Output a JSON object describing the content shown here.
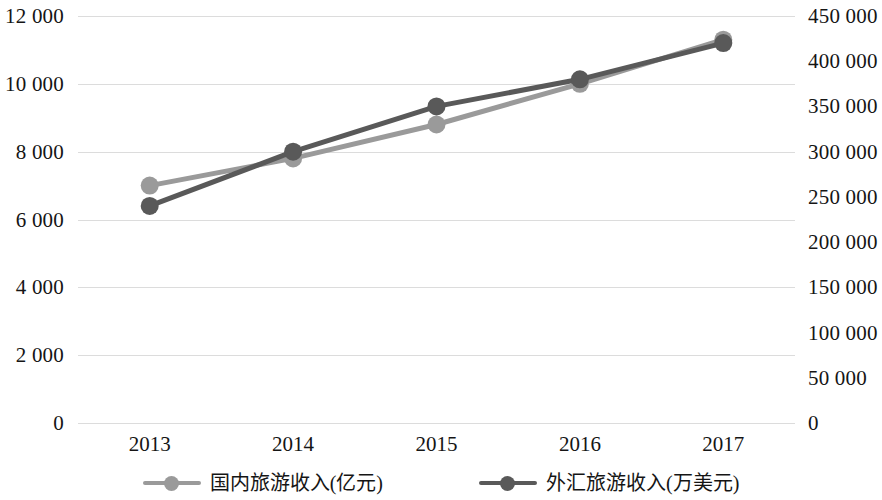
{
  "chart_data": {
    "type": "line",
    "title": "",
    "xlabel": "",
    "ylabel": "",
    "grid": true,
    "legend_position": "bottom",
    "categories": [
      "2013",
      "2014",
      "2015",
      "2016",
      "2017"
    ],
    "axes": {
      "left": {
        "label": "国内旅游收入(亿元)",
        "ylim": [
          0,
          12000
        ],
        "ticks": [
          "0",
          "2 000",
          "4 000",
          "6 000",
          "8 000",
          "10 000",
          "12 000"
        ],
        "tick_values": [
          0,
          2000,
          4000,
          6000,
          8000,
          10000,
          12000
        ]
      },
      "right": {
        "label": "外汇旅游收入(万美元)",
        "ylim": [
          0,
          450000
        ],
        "ticks": [
          "0",
          "50 000",
          "100 000",
          "150 000",
          "200 000",
          "250 000",
          "300 000",
          "350 000",
          "400 000",
          "450 000"
        ],
        "tick_values": [
          0,
          50000,
          100000,
          150000,
          200000,
          250000,
          300000,
          350000,
          400000,
          450000
        ]
      }
    },
    "series": [
      {
        "name": "国内旅游收入(亿元)",
        "axis": "left",
        "color": "#9a9a9a",
        "marker": "circle",
        "values": [
          7000,
          7800,
          8800,
          10000,
          11300
        ]
      },
      {
        "name": "外汇旅游收入(万美元)",
        "axis": "right",
        "color": "#595959",
        "marker": "circle",
        "values": [
          240000,
          300000,
          350000,
          380000,
          420000
        ]
      }
    ]
  },
  "legend": {
    "items": [
      {
        "label": "国内旅游收入(亿元)",
        "color": "#9a9a9a"
      },
      {
        "label": "外汇旅游收入(万美元)",
        "color": "#595959"
      }
    ]
  },
  "colors": {
    "domestic_series": "#9a9a9a",
    "foreign_series": "#595959",
    "gridline": "#d6d6d6",
    "text": "#151515",
    "background": "#ffffff"
  }
}
